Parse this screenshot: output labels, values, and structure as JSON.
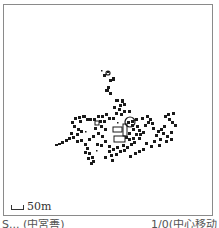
{
  "map": {
    "scale_bar": {
      "label": "50m"
    },
    "caption": {
      "left": "S... (中宮善)",
      "right": "1/0(中心移动"
    },
    "colors": {
      "building": "#1a1a1a",
      "frame": "#8a8a8a",
      "background": "#ffffff"
    },
    "features": {
      "buildings": [
        [
          103,
          74,
          3,
          3
        ],
        [
          107,
          71,
          2,
          2
        ],
        [
          112,
          77,
          3,
          4
        ],
        [
          109,
          79,
          3,
          3
        ],
        [
          107,
          86,
          3,
          3
        ],
        [
          105,
          89,
          4,
          3
        ],
        [
          109,
          92,
          3,
          3
        ],
        [
          115,
          99,
          4,
          3
        ],
        [
          121,
          99,
          3,
          4
        ],
        [
          119,
          104,
          3,
          3
        ],
        [
          123,
          103,
          3,
          3
        ],
        [
          113,
          106,
          3,
          3
        ],
        [
          118,
          108,
          3,
          3
        ],
        [
          123,
          110,
          3,
          3
        ],
        [
          128,
          110,
          3,
          3
        ],
        [
          120,
          113,
          3,
          3
        ],
        [
          115,
          112,
          3,
          3
        ],
        [
          74,
          117,
          3,
          3
        ],
        [
          78,
          116,
          3,
          3
        ],
        [
          82,
          115,
          4,
          3
        ],
        [
          86,
          118,
          3,
          3
        ],
        [
          79,
          120,
          3,
          3
        ],
        [
          71,
          121,
          3,
          3
        ],
        [
          89,
          118,
          3,
          3
        ],
        [
          93,
          118,
          3,
          3
        ],
        [
          97,
          115,
          3,
          3
        ],
        [
          101,
          115,
          3,
          3
        ],
        [
          105,
          113,
          3,
          3
        ],
        [
          99,
          120,
          3,
          3
        ],
        [
          103,
          120,
          3,
          3
        ],
        [
          108,
          117,
          3,
          3
        ],
        [
          112,
          117,
          3,
          3
        ],
        [
          73,
          125,
          3,
          3
        ],
        [
          77,
          128,
          3,
          3
        ],
        [
          80,
          130,
          3,
          3
        ],
        [
          70,
          132,
          3,
          3
        ],
        [
          76,
          133,
          3,
          3
        ],
        [
          61,
          141,
          3,
          3
        ],
        [
          65,
          139,
          3,
          3
        ],
        [
          68,
          137,
          3,
          3
        ],
        [
          72,
          136,
          3,
          3
        ],
        [
          58,
          143,
          3,
          2
        ],
        [
          55,
          144,
          3,
          2
        ],
        [
          76,
          140,
          3,
          3
        ],
        [
          80,
          139,
          3,
          3
        ],
        [
          84,
          143,
          3,
          3
        ],
        [
          86,
          147,
          3,
          3
        ],
        [
          84,
          151,
          3,
          3
        ],
        [
          88,
          152,
          3,
          3
        ],
        [
          91,
          156,
          3,
          3
        ],
        [
          92,
          160,
          3,
          3
        ],
        [
          87,
          157,
          3,
          3
        ],
        [
          90,
          162,
          3,
          3
        ],
        [
          96,
          143,
          3,
          3
        ],
        [
          100,
          144,
          3,
          3
        ],
        [
          104,
          140,
          3,
          3
        ],
        [
          108,
          145,
          3,
          3
        ],
        [
          108,
          150,
          3,
          3
        ],
        [
          112,
          148,
          3,
          3
        ],
        [
          116,
          146,
          3,
          3
        ],
        [
          110,
          154,
          3,
          3
        ],
        [
          115,
          153,
          3,
          3
        ],
        [
          119,
          150,
          3,
          3
        ],
        [
          123,
          149,
          3,
          3
        ],
        [
          126,
          146,
          3,
          3
        ],
        [
          130,
          143,
          3,
          3
        ],
        [
          122,
          144,
          3,
          3
        ],
        [
          128,
          138,
          3,
          3
        ],
        [
          132,
          137,
          3,
          3
        ],
        [
          127,
          121,
          3,
          3
        ],
        [
          131,
          120,
          3,
          3
        ],
        [
          135,
          118,
          3,
          3
        ],
        [
          131,
          124,
          3,
          3
        ],
        [
          136,
          125,
          3,
          3
        ],
        [
          132,
          128,
          3,
          3
        ],
        [
          138,
          129,
          3,
          3
        ],
        [
          139,
          133,
          3,
          3
        ],
        [
          142,
          131,
          3,
          3
        ],
        [
          135,
          133,
          3,
          3
        ],
        [
          128,
          132,
          3,
          3
        ],
        [
          125,
          136,
          3,
          3
        ],
        [
          133,
          141,
          3,
          3
        ],
        [
          138,
          137,
          3,
          3
        ],
        [
          141,
          117,
          3,
          3
        ],
        [
          146,
          115,
          3,
          3
        ],
        [
          149,
          118,
          3,
          3
        ],
        [
          151,
          122,
          3,
          3
        ],
        [
          147,
          121,
          3,
          3
        ],
        [
          144,
          124,
          3,
          3
        ],
        [
          152,
          127,
          3,
          3
        ],
        [
          157,
          130,
          3,
          3
        ],
        [
          155,
          134,
          3,
          3
        ],
        [
          160,
          128,
          3,
          3
        ],
        [
          163,
          125,
          3,
          3
        ],
        [
          159,
          138,
          3,
          3
        ],
        [
          153,
          140,
          3,
          3
        ],
        [
          164,
          115,
          3,
          3
        ],
        [
          168,
          118,
          3,
          3
        ],
        [
          171,
          121,
          3,
          3
        ],
        [
          174,
          124,
          3,
          3
        ],
        [
          167,
          113,
          3,
          3
        ],
        [
          172,
          112,
          3,
          3
        ],
        [
          162,
          132,
          3,
          3
        ],
        [
          166,
          135,
          3,
          3
        ],
        [
          170,
          131,
          3,
          3
        ],
        [
          165,
          140,
          3,
          3
        ],
        [
          170,
          138,
          3,
          3
        ],
        [
          158,
          144,
          3,
          3
        ],
        [
          145,
          142,
          3,
          3
        ],
        [
          150,
          145,
          3,
          3
        ],
        [
          142,
          148,
          3,
          3
        ],
        [
          138,
          150,
          3,
          3
        ],
        [
          134,
          152,
          3,
          3
        ],
        [
          129,
          155,
          3,
          3
        ],
        [
          100,
          125,
          3,
          3
        ],
        [
          104,
          128,
          3,
          3
        ],
        [
          94,
          127,
          3,
          3
        ],
        [
          97,
          132,
          3,
          3
        ],
        [
          101,
          135,
          3,
          3
        ],
        [
          92,
          135,
          3,
          3
        ],
        [
          88,
          138,
          3,
          3
        ],
        [
          111,
          159,
          3,
          3
        ],
        [
          104,
          156,
          3,
          3
        ]
      ],
      "outlined_buildings": [
        [
          113,
          127,
          9,
          5
        ],
        [
          114,
          136,
          11,
          6
        ],
        [
          123,
          124,
          4,
          12
        ],
        [
          95,
          121,
          4,
          4
        ]
      ],
      "circles": [
        {
          "cx": 108,
          "cy": 73,
          "r": 2
        },
        {
          "cx": 130,
          "cy": 122,
          "r": 5
        }
      ],
      "small_dots": [
        [
          101,
          70
        ],
        [
          85,
          131
        ],
        [
          96,
          150
        ],
        [
          117,
          122
        ]
      ]
    }
  }
}
